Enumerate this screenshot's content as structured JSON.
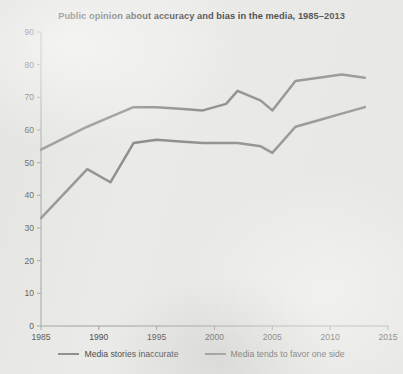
{
  "chart_data": {
    "type": "line",
    "title": "Public opinion about accuracy and bias in the media, 1985–2013",
    "xlabel": "",
    "ylabel": "",
    "xlim": [
      1985,
      2015
    ],
    "ylim": [
      0,
      90
    ],
    "xticks": [
      1985,
      1990,
      1995,
      2000,
      2005,
      2010,
      2015
    ],
    "yticks": [
      0,
      10,
      20,
      30,
      40,
      50,
      60,
      70,
      80,
      90
    ],
    "xtick_labels": [
      "1985",
      "1990",
      "1995",
      "2000",
      "2005",
      "2010",
      "2015"
    ],
    "ytick_labels": [
      "0",
      "10",
      "20",
      "30",
      "40",
      "50",
      "60",
      "70",
      "80",
      "90"
    ],
    "grid": false,
    "legend_position": "bottom",
    "series": [
      {
        "name": "Media stories inaccurate",
        "color": "#767676",
        "x": [
          1985,
          1989,
          1991,
          1993,
          1995,
          1997,
          1999,
          2001,
          2002,
          2004,
          2005,
          2007,
          2009,
          2011,
          2013
        ],
        "values": [
          33,
          48,
          44,
          56,
          57,
          56.5,
          56,
          56,
          56,
          55,
          53,
          61,
          63,
          65,
          67
        ]
      },
      {
        "name": "Media tends to favor one side",
        "color": "#767676",
        "x": [
          1985,
          1989,
          1991,
          1993,
          1995,
          1997,
          1999,
          2001,
          2002,
          2004,
          2005,
          2007,
          2009,
          2011,
          2013
        ],
        "values": [
          54,
          61,
          64,
          67,
          67,
          66.5,
          66,
          68,
          72,
          69,
          66,
          75,
          76,
          77,
          76
        ]
      }
    ]
  },
  "legend": {
    "entries": [
      {
        "label": "Media stories inaccurate"
      },
      {
        "label": "Media tends to favor one side"
      }
    ]
  },
  "colors": {
    "line": "#767676",
    "axis": "#8d8d8d",
    "background": "#e9e9e7",
    "text": "#1b1b1b"
  }
}
